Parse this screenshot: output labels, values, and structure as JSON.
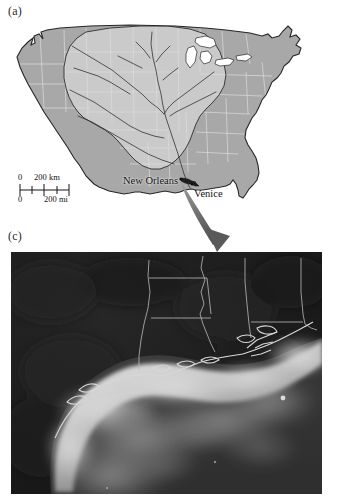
{
  "figure": {
    "panels": [
      {
        "id": "a",
        "label": "(a)",
        "type": "reference-map",
        "subject": "United States with Mississippi River drainage basin"
      },
      {
        "id": "c",
        "label": "(c)",
        "type": "satellite-image",
        "subject": "Northern Gulf of Mexico, Louisiana coast sediment plume"
      }
    ]
  },
  "map": {
    "label": "(a)",
    "city_labels": [
      {
        "name": "new-orleans",
        "text": "New Orleans"
      },
      {
        "name": "venice",
        "text": "Venice"
      }
    ],
    "scalebar": {
      "km_zero": "0",
      "km_max": "200 km",
      "mi_zero": "0",
      "mi_max": "200 mi"
    },
    "colors": {
      "land_fill": "#a8a8a8",
      "basin_fill": "#cacaca",
      "state_border": "#d8d8d8",
      "coast_outline": "#2a2a2a",
      "river": "#3a3a3a",
      "background": "#ffffff"
    }
  },
  "satellite": {
    "label": "(c)",
    "colors": {
      "land": "#0d0d0d",
      "land_mid": "#1e1e1e",
      "water_deep": "#2e2e2e",
      "plume_bright": "#dcdcdc",
      "plume_mid": "#9a9a9a",
      "border_line": "#bdbdbd",
      "frame": "#ffffff"
    }
  },
  "arrow": {
    "name": "connector-arrow",
    "color": "#6d6d6d",
    "description": "curved arrow from Venice on the map to the satellite image"
  }
}
